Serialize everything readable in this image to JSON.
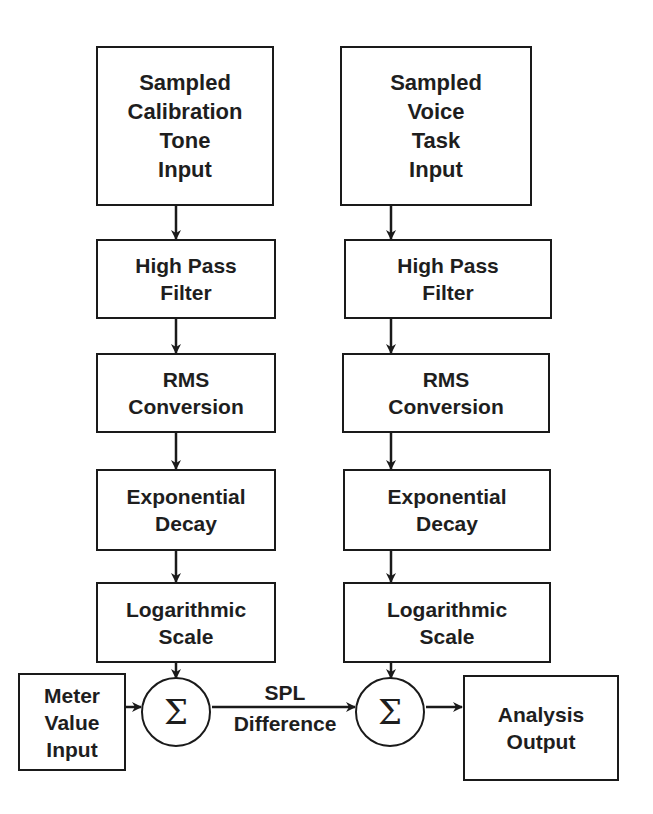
{
  "diagram": {
    "left_chain": [
      {
        "id": "cal-input",
        "label": "Sampled\nCalibration\nTone\nInput"
      },
      {
        "id": "cal-hpf",
        "label": "High Pass\nFilter"
      },
      {
        "id": "cal-rms",
        "label": "RMS\nConversion"
      },
      {
        "id": "cal-exp",
        "label": "Exponential\nDecay"
      },
      {
        "id": "cal-log",
        "label": "Logarithmic\nScale"
      }
    ],
    "right_chain": [
      {
        "id": "voice-input",
        "label": "Sampled\nVoice\nTask\nInput"
      },
      {
        "id": "voice-hpf",
        "label": "High Pass\nFilter"
      },
      {
        "id": "voice-rms",
        "label": "RMS\nConversion"
      },
      {
        "id": "voice-exp",
        "label": "Exponential\nDecay"
      },
      {
        "id": "voice-log",
        "label": "Logarithmic\nScale"
      }
    ],
    "meter_input": {
      "label": "Meter\nValue\nInput"
    },
    "sum_left": {
      "symbol": "Σ"
    },
    "sum_right": {
      "symbol": "Σ"
    },
    "edge_label": {
      "line1": "SPL",
      "line2": "Difference"
    },
    "output": {
      "label": "Analysis\nOutput"
    }
  }
}
